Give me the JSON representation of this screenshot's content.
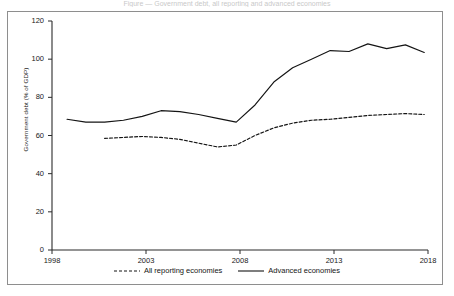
{
  "caption": {
    "clipped_text": "Figure — Government debt, all reporting and advanced economies"
  },
  "chart_data": {
    "type": "line",
    "title": "",
    "xlabel": "",
    "ylabel": "Government debt (% of GDP)",
    "xlim": [
      1998,
      2018
    ],
    "ylim": [
      0,
      120
    ],
    "yticks": [
      0,
      20,
      40,
      60,
      80,
      100,
      120
    ],
    "ytick_labels": [
      "0",
      "20",
      "40",
      "60",
      "80",
      "100",
      "120"
    ],
    "xticks": [
      1998,
      2003,
      2008,
      2013,
      2018
    ],
    "xtick_labels": [
      "1998",
      "2003",
      "2008",
      "2013",
      "2018"
    ],
    "grid": false,
    "legend_position": "bottom-center",
    "series": [
      {
        "name": "All reporting economies",
        "style": "dashed",
        "color": "#141414",
        "x": [
          2000.8,
          2001.8,
          2002.8,
          2003.8,
          2004.8,
          2005.8,
          2006.8,
          2007.8,
          2008.8,
          2009.8,
          2010.8,
          2011.8,
          2012.8,
          2013.8,
          2014.8,
          2015.8,
          2016.8,
          2017.8
        ],
        "values": [
          58.5,
          59.0,
          59.5,
          59.0,
          58.0,
          56.0,
          54.0,
          55.0,
          60.0,
          64.0,
          66.5,
          68.0,
          68.5,
          69.5,
          70.5,
          71.0,
          71.5,
          71.0
        ]
      },
      {
        "name": "Advanced economies",
        "style": "solid",
        "color": "#141414",
        "x": [
          1998.8,
          1999.8,
          2000.8,
          2001.8,
          2002.8,
          2003.8,
          2004.8,
          2005.8,
          2006.8,
          2007.8,
          2008.8,
          2009.8,
          2010.8,
          2011.8,
          2012.8,
          2013.8,
          2014.8,
          2015.8,
          2016.8,
          2017.8
        ],
        "values": [
          68.5,
          67.0,
          67.0,
          68.0,
          70.0,
          73.0,
          72.5,
          71.0,
          69.0,
          67.0,
          76.0,
          88.0,
          95.5,
          100.0,
          104.5,
          104.0,
          108.0,
          105.5,
          107.5,
          103.5
        ]
      }
    ]
  },
  "legend": {
    "items": [
      {
        "label": "All reporting economies",
        "style": "dashed"
      },
      {
        "label": "Advanced economies",
        "style": "solid"
      }
    ]
  }
}
